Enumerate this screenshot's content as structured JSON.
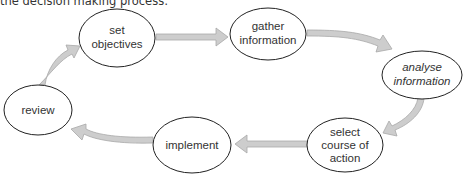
{
  "caption": "the decision making process:",
  "colors": {
    "arrow_fill": "#cdcdcd",
    "arrow_stroke": "#a8a8a8",
    "node_stroke": "#222222",
    "text": "#333333"
  },
  "nodes": [
    {
      "id": "set-objectives",
      "lines": [
        "set",
        "objectives"
      ],
      "italic": false
    },
    {
      "id": "gather-information",
      "lines": [
        "gather",
        "information"
      ],
      "italic": false
    },
    {
      "id": "analyse-information",
      "lines": [
        "analyse",
        "information"
      ],
      "italic": true
    },
    {
      "id": "select-course-of-action",
      "lines": [
        "select",
        "course of",
        "action"
      ],
      "italic": false
    },
    {
      "id": "implement",
      "lines": [
        "implement"
      ],
      "italic": false
    },
    {
      "id": "review",
      "lines": [
        "review"
      ],
      "italic": false
    }
  ],
  "edges": [
    {
      "from": "set-objectives",
      "to": "gather-information"
    },
    {
      "from": "gather-information",
      "to": "analyse-information"
    },
    {
      "from": "analyse-information",
      "to": "select-course-of-action"
    },
    {
      "from": "select-course-of-action",
      "to": "implement"
    },
    {
      "from": "implement",
      "to": "review"
    },
    {
      "from": "review",
      "to": "set-objectives"
    }
  ]
}
